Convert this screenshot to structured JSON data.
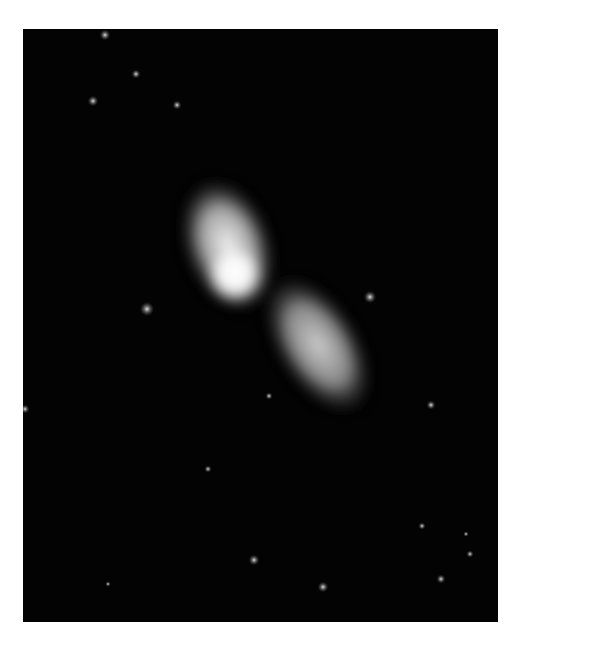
{
  "image": {
    "description": "Grayscale telescope photograph of a bipolar planetary nebula against a dark star field",
    "colors": {
      "background": "#ffffff",
      "sky": "#030303",
      "nebula_core": "#ffffff",
      "nebula_glow": "#bdbdbd"
    },
    "nebula": {
      "upper_lobe": {
        "cx": 228,
        "cy": 245,
        "rx": 45,
        "ry": 70,
        "rotate": -20
      },
      "upper_core": {
        "cx": 235,
        "cy": 275,
        "r": 28
      },
      "lower_lobe": {
        "cx": 318,
        "cy": 345,
        "rx": 42,
        "ry": 78,
        "rotate": -32
      }
    },
    "stars": [
      {
        "x": 82,
        "y": 6,
        "r": 3
      },
      {
        "x": 113,
        "y": 45,
        "r": 2.5
      },
      {
        "x": 70,
        "y": 72,
        "r": 3
      },
      {
        "x": 154,
        "y": 76,
        "r": 2.5
      },
      {
        "x": 491,
        "y": 40,
        "r": 3.5
      },
      {
        "x": 124,
        "y": 280,
        "r": 4
      },
      {
        "x": 347,
        "y": 268,
        "r": 3.5
      },
      {
        "x": 524,
        "y": 182,
        "r": 3
      },
      {
        "x": 509,
        "y": 284,
        "r": 3
      },
      {
        "x": 534,
        "y": 256,
        "r": 2.5
      },
      {
        "x": 2,
        "y": 380,
        "r": 2.5
      },
      {
        "x": 408,
        "y": 376,
        "r": 2.5
      },
      {
        "x": 246,
        "y": 367,
        "r": 2
      },
      {
        "x": 185,
        "y": 440,
        "r": 2
      },
      {
        "x": 399,
        "y": 497,
        "r": 2
      },
      {
        "x": 231,
        "y": 531,
        "r": 3
      },
      {
        "x": 300,
        "y": 558,
        "r": 3
      },
      {
        "x": 418,
        "y": 550,
        "r": 2.5
      },
      {
        "x": 447,
        "y": 525,
        "r": 2
      },
      {
        "x": 443,
        "y": 505,
        "r": 1.5
      },
      {
        "x": 85,
        "y": 555,
        "r": 1.5
      }
    ]
  }
}
